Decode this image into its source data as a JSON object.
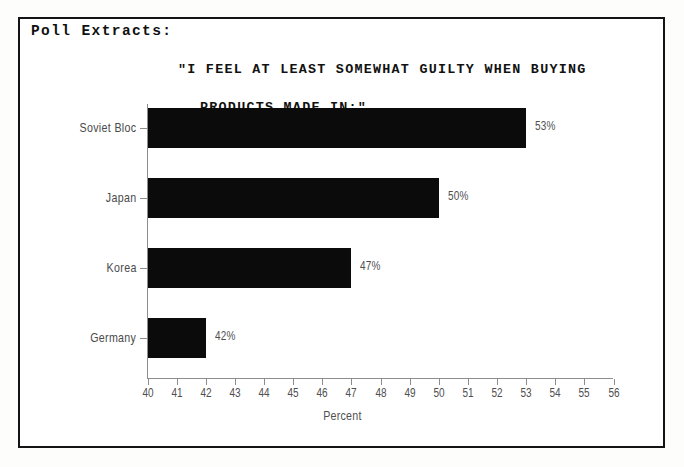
{
  "document": {
    "section_label": "Poll Extracts:"
  },
  "chart_data": {
    "type": "bar",
    "orientation": "horizontal",
    "title": "\"I FEEL AT LEAST SOMEWHAT GUILTY WHEN BUYING PRODUCTS MADE IN:\"",
    "title_line1": "\"I FEEL AT LEAST SOMEWHAT GUILTY WHEN BUYING",
    "title_line2": "PRODUCTS MADE IN:\"",
    "categories": [
      "Soviet Bloc",
      "Japan",
      "Korea",
      "Germany"
    ],
    "values": [
      53,
      50,
      47,
      42
    ],
    "value_labels": [
      "53%",
      "50%",
      "47%",
      "42%"
    ],
    "xlabel": "Percent",
    "ylabel": "",
    "xlim": [
      40,
      56
    ],
    "xticks": [
      40,
      41,
      42,
      43,
      44,
      45,
      46,
      47,
      48,
      49,
      50,
      51,
      52,
      53,
      54,
      55,
      56
    ],
    "xtick_labels": [
      "40",
      "41",
      "42",
      "43",
      "44",
      "45",
      "46",
      "47",
      "48",
      "49",
      "50",
      "51",
      "52",
      "53",
      "54",
      "55",
      "56"
    ],
    "grid": false,
    "legend": false,
    "bar_color": "#0b0b0b",
    "axis_color": "#8d8d8d",
    "text_color": "#4f4f4f"
  }
}
